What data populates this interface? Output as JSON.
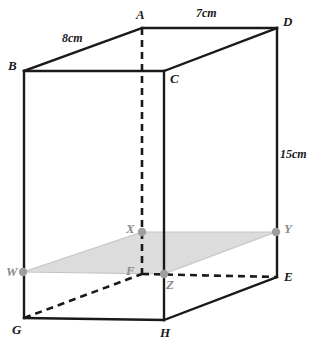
{
  "figure": {
    "type": "geometry-diagram",
    "canvas": {
      "width": 318,
      "height": 353,
      "background": "#ffffff"
    },
    "style": {
      "solid_edge_color": "#1a1a1a",
      "hidden_edge_color": "#1a1a1a",
      "shaded_plane_fill": "#dcdcdc",
      "shaded_plane_stroke": "#c0c0c0",
      "marker_fill": "#9e9e9e",
      "faint_label_color": "#8c8c8c"
    }
  },
  "dimensions": [
    {
      "id": "width-top-left",
      "text": "8cm",
      "edge": "B-A",
      "x": 62,
      "y": 32
    },
    {
      "id": "depth-top-right",
      "text": "7cm",
      "edge": "A-D",
      "x": 196,
      "y": 7
    },
    {
      "id": "height-right",
      "text": "15cm",
      "edge": "D-E",
      "x": 280,
      "y": 148
    }
  ],
  "vertices": [
    {
      "id": "A",
      "label": "A",
      "x": 142,
      "y": 28,
      "label_x": 136,
      "label_y": 8,
      "faint": false
    },
    {
      "id": "D",
      "label": "D",
      "x": 277,
      "y": 28,
      "label_x": 283,
      "label_y": 15,
      "faint": false
    },
    {
      "id": "B",
      "label": "B",
      "x": 24,
      "y": 71,
      "label_x": 8,
      "label_y": 59,
      "faint": false
    },
    {
      "id": "C",
      "label": "C",
      "x": 164,
      "y": 71,
      "label_x": 170,
      "label_y": 72,
      "faint": false
    },
    {
      "id": "E",
      "label": "E",
      "x": 277,
      "y": 277,
      "label_x": 284,
      "label_y": 270,
      "faint": false
    },
    {
      "id": "F",
      "label": "F",
      "x": 142,
      "y": 274,
      "label_x": 126,
      "label_y": 264,
      "faint": true
    },
    {
      "id": "G",
      "label": "G",
      "x": 24,
      "y": 318,
      "label_x": 12,
      "label_y": 323,
      "faint": false
    },
    {
      "id": "H",
      "label": "H",
      "x": 164,
      "y": 320,
      "label_x": 160,
      "label_y": 326,
      "faint": false
    }
  ],
  "section_points": [
    {
      "id": "W",
      "label": "W",
      "x": 23,
      "y": 272,
      "label_x": 6,
      "label_y": 265,
      "faint": true
    },
    {
      "id": "X",
      "label": "X",
      "x": 142,
      "y": 232,
      "label_x": 126,
      "label_y": 222,
      "faint": true
    },
    {
      "id": "Y",
      "label": "Y",
      "x": 276,
      "y": 232,
      "label_x": 284,
      "label_y": 222,
      "faint": true
    },
    {
      "id": "Z",
      "label": "Z",
      "x": 164,
      "y": 274,
      "label_x": 166,
      "label_y": 278,
      "faint": true
    }
  ],
  "edges": {
    "solid": [
      {
        "from": "B",
        "to": "A"
      },
      {
        "from": "A",
        "to": "D"
      },
      {
        "from": "B",
        "to": "C"
      },
      {
        "from": "C",
        "to": "D"
      },
      {
        "from": "B",
        "to": "G"
      },
      {
        "from": "C",
        "to": "H"
      },
      {
        "from": "D",
        "to": "E"
      },
      {
        "from": "G",
        "to": "H"
      },
      {
        "from": "H",
        "to": "E"
      }
    ],
    "hidden": [
      {
        "from": "A",
        "to": "F"
      },
      {
        "from": "G",
        "to": "F"
      },
      {
        "from": "F",
        "to": "E"
      }
    ]
  },
  "shaded_plane": {
    "id": "WXYZ",
    "points": "W,X,Y,Z"
  }
}
